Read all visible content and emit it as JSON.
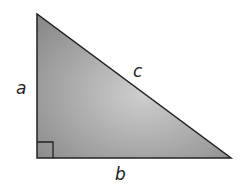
{
  "diagram": {
    "labels": {
      "a": "a",
      "b": "b",
      "c": "c"
    },
    "colors": {
      "fill_light": "#c8c8c8",
      "fill_dark": "#8a8a8a",
      "stroke": "#222222"
    }
  }
}
